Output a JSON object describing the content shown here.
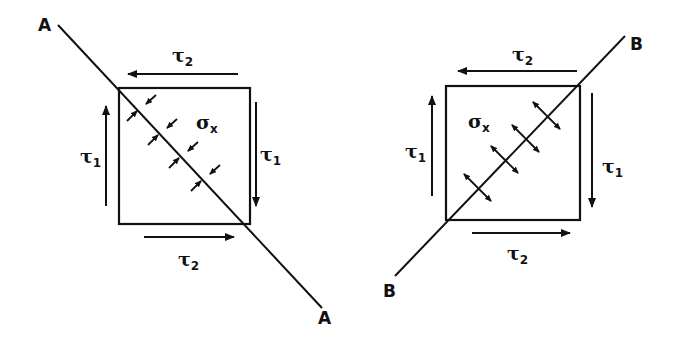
{
  "diagrams": [
    {
      "id": "left",
      "stress_type": "compressive",
      "line_label_start": "A",
      "line_label_end": "A",
      "sigma": {
        "symbol": "σ",
        "sub": "x"
      },
      "tau_top": {
        "symbol": "τ",
        "sub": "2"
      },
      "tau_bottom": {
        "symbol": "τ",
        "sub": "2"
      },
      "tau_left": {
        "symbol": "τ",
        "sub": "1"
      },
      "tau_right": {
        "symbol": "τ",
        "sub": "1"
      }
    },
    {
      "id": "right",
      "stress_type": "tensile",
      "line_label_start": "B",
      "line_label_end": "B",
      "sigma": {
        "symbol": "σ",
        "sub": "x"
      },
      "tau_top": {
        "symbol": "τ",
        "sub": "2"
      },
      "tau_bottom": {
        "symbol": "τ",
        "sub": "2"
      },
      "tau_left": {
        "symbol": "τ",
        "sub": "1"
      },
      "tau_right": {
        "symbol": "τ",
        "sub": "1"
      }
    }
  ],
  "colors": {
    "ink": "#111111",
    "background": "#ffffff"
  }
}
